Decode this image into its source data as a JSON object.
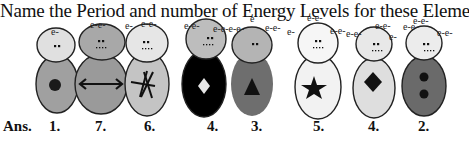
{
  "title": "Name the Period and number of Energy Levels for these Element",
  "answer_prefix": "Ans.",
  "figures": [
    {
      "id": 1,
      "answer": "1.",
      "head_color": "#e0e0e0",
      "body_color": "#a0a0a0",
      "symbol": "circle",
      "electron_label": "e-"
    },
    {
      "id": 2,
      "answer": "7.",
      "head_color": "#a8a8a8",
      "body_color": "#9a9a9a",
      "symbol": "double-arrow",
      "electron_label": "e-e-"
    },
    {
      "id": 3,
      "answer": "6.",
      "head_color": "#e6e6e6",
      "body_color": "#c4c4c4",
      "symbol": "asterisk",
      "electron_label": "e- e-e-"
    },
    {
      "id": 4,
      "answer": "4.",
      "head_color": "#bdbdbd",
      "body_color": "#000000",
      "symbol": "diamond-white",
      "electron_label": "e-e- e-e-e-e-"
    },
    {
      "id": 5,
      "answer": "3.",
      "head_color": "#b4b4b4",
      "body_color": "#6e6e6e",
      "symbol": "triangle",
      "electron_label": "e e-e-"
    },
    {
      "id": 6,
      "answer": "5.",
      "head_color": "#f6f6f6",
      "body_color": "#f2f2f2",
      "symbol": "star",
      "electron_label": "e-e- e-e-"
    },
    {
      "id": 7,
      "answer": "4.",
      "head_color": "#e8e8e8",
      "body_color": "#dedede",
      "symbol": "diamond-black",
      "electron_label": "e-e- e-e-e-"
    },
    {
      "id": 8,
      "answer": "2.",
      "head_color": "#ececec",
      "body_color": "#6a6a6a",
      "symbol": "two-dots",
      "electron_label": "e-e-e-e- e-e-"
    }
  ],
  "answers": {
    "prefix": "Ans.",
    "a1": "1.",
    "a2": "7.",
    "a3": "6.",
    "a4": "4.",
    "a5": "3.",
    "a6": "5.",
    "a7": "4.",
    "a8": "2."
  }
}
